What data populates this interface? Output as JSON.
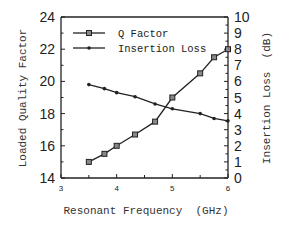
{
  "chart_data": {
    "type": "line",
    "title": "",
    "xlabel": "Resonant Frequency  (GHz)",
    "ylabel": "Loaded Quality Factor",
    "y2label": "Insertion Loss  (dB)",
    "xlim": [
      3,
      6
    ],
    "ylim": [
      14,
      24
    ],
    "y2lim": [
      0,
      10
    ],
    "x_ticks": [
      "3",
      "4",
      "5",
      "6"
    ],
    "y_ticks": [
      "14",
      "16",
      "18",
      "20",
      "22",
      "24"
    ],
    "y2_ticks": [
      "0",
      "1",
      "2",
      "3",
      "4",
      "5",
      "6",
      "7",
      "8",
      "9",
      "10"
    ],
    "grid": false,
    "legend_position": "upper-left",
    "series": [
      {
        "name": "Q Factor",
        "axis": "left",
        "marker": "square",
        "x": [
          3.5,
          3.78,
          4.0,
          4.33,
          4.69,
          5.0,
          5.5,
          5.75,
          6.0
        ],
        "values": [
          15.0,
          15.5,
          16.0,
          16.7,
          17.5,
          19.0,
          20.5,
          21.5,
          22.0
        ]
      },
      {
        "name": "Insertion Loss",
        "axis": "right",
        "marker": "dot",
        "x": [
          3.5,
          3.78,
          4.0,
          4.33,
          4.69,
          5.0,
          5.5,
          5.75,
          6.0
        ],
        "values": [
          5.8,
          5.55,
          5.3,
          5.05,
          4.6,
          4.3,
          4.0,
          3.7,
          3.55
        ]
      }
    ]
  },
  "legend": {
    "items": [
      "Q Factor",
      "Insertion Loss"
    ]
  },
  "axes": {
    "xlabel": "Resonant Frequency  (GHz)",
    "ylabel": "Loaded Quality Factor",
    "y2label": "Insertion Loss  (dB)"
  }
}
